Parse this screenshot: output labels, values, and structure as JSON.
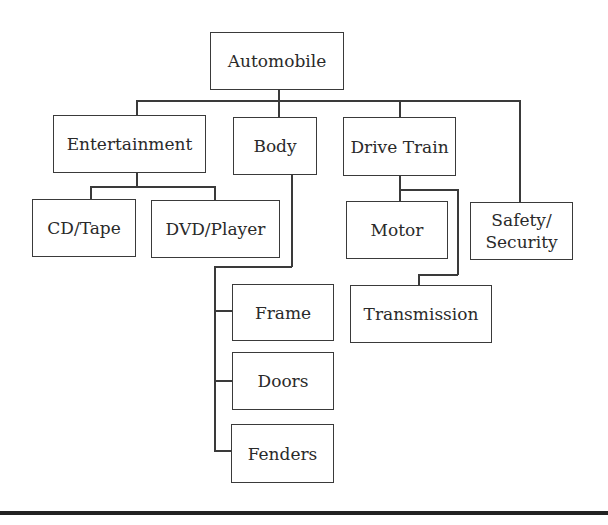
{
  "diagram": {
    "type": "hierarchy",
    "root": "Automobile",
    "nodes": {
      "automobile": "Automobile",
      "entertainment": "Entertainment",
      "body": "Body",
      "drive_train": "Drive Train",
      "safety": "Safety/\nSecurity",
      "cd_tape": "CD/Tape",
      "dvd_player": "DVD/Player",
      "motor": "Motor",
      "transmission": "Transmission",
      "frame": "Frame",
      "doors": "Doors",
      "fenders": "Fenders"
    },
    "safety_lines": [
      "Safety/",
      "Security"
    ],
    "edges": [
      [
        "Automobile",
        "Entertainment"
      ],
      [
        "Automobile",
        "Body"
      ],
      [
        "Automobile",
        "Drive Train"
      ],
      [
        "Automobile",
        "Safety/Security"
      ],
      [
        "Entertainment",
        "CD/Tape"
      ],
      [
        "Entertainment",
        "DVD/Player"
      ],
      [
        "Body",
        "Frame"
      ],
      [
        "Body",
        "Doors"
      ],
      [
        "Body",
        "Fenders"
      ],
      [
        "Drive Train",
        "Motor"
      ],
      [
        "Drive Train",
        "Transmission"
      ]
    ]
  }
}
